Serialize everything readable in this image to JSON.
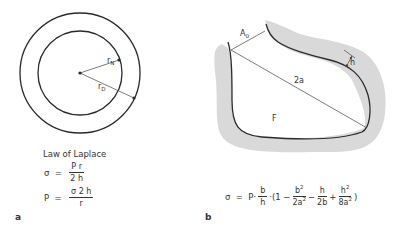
{
  "panel_a": {
    "label": "a",
    "inner_radius_label": "r",
    "inner_radius_sub": "N",
    "outer_radius_label": "r",
    "outer_radius_sub": "D",
    "title": "Law of Laplace",
    "eq1": {
      "lhs": "σ",
      "equals": "=",
      "num": "P r",
      "den": "2 h"
    },
    "eq2": {
      "lhs": "P",
      "equals": "=",
      "num": "σ 2 h",
      "den": "r"
    }
  },
  "panel_b": {
    "label": "b",
    "area_label": "A",
    "area_sub": "0",
    "diameter_label": "2a",
    "thickness_label": "h",
    "region_label": "F",
    "formula": {
      "lhs": "σ",
      "equals": "=",
      "p": "P·",
      "f1_num": "b",
      "f1_den": "h",
      "open": "·(1 −",
      "f2_num": "b",
      "f2_num_sup": "2",
      "f2_den": "2a",
      "f2_den_sup": "2",
      "minus": "−",
      "f3_num": "h",
      "f3_den": "2b",
      "plus": "+",
      "f4_num": "h",
      "f4_num_sup": "2",
      "f4_den": "8a",
      "f4_den_sup": "2",
      "close": ")"
    }
  },
  "colors": {
    "line": "#2a2a2a",
    "shade": "#d9d9d9",
    "background": "#ffffff"
  }
}
